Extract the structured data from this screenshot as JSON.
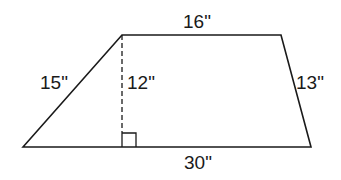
{
  "diagram": {
    "type": "trapezoid",
    "labels": {
      "top": "16\"",
      "left": "15\"",
      "height": "12\"",
      "right": "13\"",
      "bottom": "30\""
    },
    "vertices": {
      "bottom_left": [
        23,
        147
      ],
      "top_left": [
        122,
        35
      ],
      "top_right": [
        281,
        35
      ],
      "bottom_right": [
        311,
        147
      ]
    },
    "colors": {
      "stroke": "#1a1a1a",
      "background": "#ffffff"
    }
  }
}
